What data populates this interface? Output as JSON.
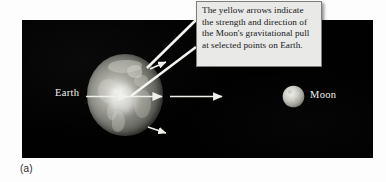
{
  "figure": {
    "caption": "(a)",
    "panel_background": "#010101",
    "page_background": "#ffffff"
  },
  "callout": {
    "text": "The yellow arrows indicate the strength and direction of the Moon's gravitational pull at selected points on Earth.",
    "background_color": "#e9e9e7",
    "border_color": "#7d7d7a",
    "text_color": "#16161a",
    "leader_line_color": "#ffffff"
  },
  "bodies": {
    "earth": {
      "label": "Earth",
      "label_color": "#f2f2f2"
    },
    "moon": {
      "label": "Moon",
      "label_color": "#f2f2f2"
    }
  },
  "arrows": {
    "color": "#f0f0ea",
    "items": [
      {
        "name": "arrow-near-side",
        "description": "long arrow from left of Earth through center toward Moon"
      },
      {
        "name": "arrow-center",
        "description": "arrow from Earth center pointing right toward Moon"
      },
      {
        "name": "arrow-far-side",
        "description": "short arrow right of Earth pointing toward Moon"
      },
      {
        "name": "arrow-top",
        "description": "short arrow at Earth's upper right limb angled toward Moon"
      },
      {
        "name": "arrow-bottom",
        "description": "short arrow at Earth's lower right limb angled toward Moon"
      }
    ]
  }
}
